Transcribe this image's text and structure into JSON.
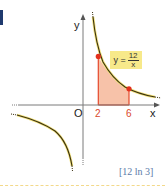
{
  "marker": {
    "color": "#1f3a6e"
  },
  "axes": {
    "x_label": "x",
    "y_label": "y",
    "origin_label": "O"
  },
  "ticks": {
    "a": "2",
    "b": "6"
  },
  "equation": {
    "lhs": "y =",
    "numerator": "12",
    "denominator": "x"
  },
  "answer": "[12 ln 3]",
  "colors": {
    "curve": "#3a3010",
    "curve_glow": "#f2e27a",
    "area_fill": "#f6b79a",
    "area_edge": "#e5482b",
    "point": "#e3311d",
    "axis": "#7a7a7a",
    "equation_bg": "#f7e98a",
    "answer_text": "#5a7aa8"
  },
  "function": {
    "expression": "y = 12/x",
    "shaded_interval": [
      2,
      6
    ],
    "marked_points": [
      [
        2,
        6
      ],
      [
        6,
        2
      ]
    ]
  }
}
